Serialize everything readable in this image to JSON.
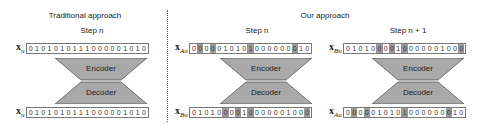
{
  "sections": [
    {
      "title": "Traditional approach"
    },
    {
      "title": "Our approach"
    }
  ],
  "panels": [
    {
      "step": "Step n",
      "input": {
        "var": "x",
        "sub": "u",
        "bits": "0101010111000001010",
        "highlight": []
      },
      "encoder_label": "Encoder",
      "decoder_label": "Decoder",
      "output": {
        "var": "x",
        "sub": "u",
        "bits": "0101010111000001010",
        "highlight": []
      }
    },
    {
      "step": "Step n",
      "input": {
        "var": "x",
        "sub": "Au",
        "bits": "0000010101000000010",
        "highlight": [
          1,
          3,
          9,
          16
        ]
      },
      "encoder_label": "Encoder",
      "decoder_label": "Decoder",
      "output": {
        "var": "x",
        "sub": "Bu",
        "bits": "0101000010000001000",
        "highlight": [
          5,
          7,
          9,
          18
        ]
      }
    },
    {
      "step": "Step n + 1",
      "input": {
        "var": "x",
        "sub": "Bu",
        "bits": "0101000010000001000",
        "highlight": [
          5,
          7,
          9,
          18
        ]
      },
      "encoder_label": "Encoder",
      "decoder_label": "Decoder",
      "output": {
        "var": "x",
        "sub": "Au",
        "bits": "0000010101000000010",
        "highlight": [
          1,
          3,
          9,
          16
        ]
      }
    }
  ],
  "colors": {
    "block_fill": "#a9a9a9",
    "block_stroke": "#555555",
    "bit_highlight": "#9a9a9a"
  }
}
